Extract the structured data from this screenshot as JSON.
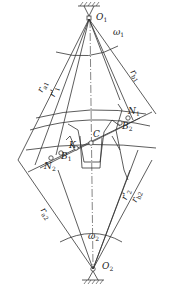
{
  "diagram": {
    "centers": {
      "top": {
        "label": "O",
        "sub": "1",
        "x": 89,
        "y": 18
      },
      "bottom": {
        "label": "O",
        "sub": "2",
        "x": 93,
        "y": 269
      }
    },
    "angular_velocities": {
      "top": {
        "label": "ω",
        "sub": "1"
      },
      "bottom": {
        "label": "ω",
        "sub": "2"
      }
    },
    "radii_labels": {
      "ra1": {
        "label": "r",
        "sub": "a1"
      },
      "r1p": {
        "label": "r'",
        "sub": "1"
      },
      "rb1": {
        "label": "r",
        "sub": "b1"
      },
      "ra2": {
        "label": "r",
        "sub": "a2"
      },
      "r2p": {
        "label": "r'",
        "sub": "2"
      },
      "rb2": {
        "label": "r",
        "sub": "b2"
      }
    },
    "points": {
      "C": {
        "label": "C"
      },
      "K": {
        "label": "K"
      },
      "N1": {
        "label": "N",
        "sub": "1"
      },
      "N2": {
        "label": "N",
        "sub": "2"
      },
      "B1": {
        "label": "B",
        "sub": "1"
      },
      "B2": {
        "label": "B",
        "sub": "2"
      }
    },
    "colors": {
      "line": "#333333",
      "background": "#ffffff"
    }
  }
}
